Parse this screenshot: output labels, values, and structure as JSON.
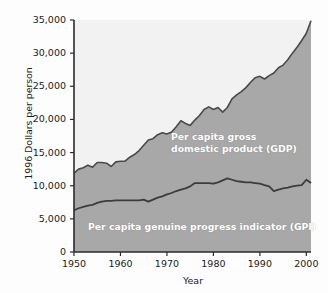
{
  "chart_data": {
    "type": "area",
    "title": "",
    "xlabel": "Year",
    "ylabel": "1996 Dollars per person",
    "xlim": [
      1950,
      2001
    ],
    "ylim": [
      0,
      35000
    ],
    "grid": false,
    "legend_position": "inline-annotation",
    "ytick_labels": [
      "35,000",
      "30,000",
      "25,000",
      "20,000",
      "15,000",
      "10,000",
      "5,000",
      "0"
    ],
    "ytick_values": [
      35000,
      30000,
      25000,
      20000,
      15000,
      10000,
      5000,
      0
    ],
    "xtick_labels": [
      "1950",
      "1960",
      "1970",
      "1980",
      "1990",
      "2000"
    ],
    "xtick_values": [
      1950,
      1960,
      1970,
      1980,
      1990,
      2000
    ],
    "x": [
      1950,
      1951,
      1952,
      1953,
      1954,
      1955,
      1956,
      1957,
      1958,
      1959,
      1960,
      1961,
      1962,
      1963,
      1964,
      1965,
      1966,
      1967,
      1968,
      1969,
      1970,
      1971,
      1972,
      1973,
      1974,
      1975,
      1976,
      1977,
      1978,
      1979,
      1980,
      1981,
      1982,
      1983,
      1984,
      1985,
      1986,
      1987,
      1988,
      1989,
      1990,
      1991,
      1992,
      1993,
      1994,
      1995,
      1996,
      1997,
      1998,
      1999,
      2000,
      2001
    ],
    "series": [
      {
        "name": "Per capita gross domestic product (GDP)",
        "label": "Per capita gross\ndomestic product (GDP)",
        "color": "#a8a8a8",
        "line_color": "#4a4a4a",
        "values": [
          11900,
          12500,
          12700,
          13100,
          12800,
          13500,
          13500,
          13400,
          12900,
          13600,
          13700,
          13700,
          14300,
          14700,
          15300,
          16100,
          16900,
          17100,
          17700,
          18000,
          17800,
          18100,
          18900,
          19800,
          19400,
          19100,
          19900,
          20600,
          21500,
          21900,
          21500,
          21800,
          21100,
          21800,
          23100,
          23700,
          24200,
          24800,
          25600,
          26300,
          26500,
          26100,
          26600,
          27000,
          27800,
          28200,
          29000,
          30000,
          30900,
          31900,
          33000,
          34900
        ]
      },
      {
        "name": "Per capita genuine progress indicator (GPI)",
        "label": "Per capita genuine progress indicator (GPI)",
        "color": "#a8a8a8",
        "line_color": "#3c3c3c",
        "values": [
          6300,
          6600,
          6800,
          7000,
          7100,
          7400,
          7600,
          7700,
          7700,
          7800,
          7800,
          7800,
          7800,
          7800,
          7800,
          7900,
          7600,
          7900,
          8200,
          8400,
          8700,
          8900,
          9200,
          9400,
          9600,
          9900,
          10400,
          10400,
          10400,
          10400,
          10300,
          10500,
          10800,
          11100,
          10900,
          10700,
          10600,
          10500,
          10500,
          10400,
          10300,
          10100,
          9900,
          9200,
          9400,
          9600,
          9700,
          9900,
          10000,
          10100,
          10900,
          10400
        ]
      }
    ],
    "upper_fill_color": "#f2f2f2",
    "plot_border_color": "#2b2b2b"
  },
  "axes": {
    "y_title": "1996 Dollars per person",
    "x_title": "Year"
  },
  "annotations": {
    "gdp_label": "Per capita gross\ndomestic product (GDP)",
    "gpi_label": "Per capita genuine progress indicator (GPI)"
  }
}
